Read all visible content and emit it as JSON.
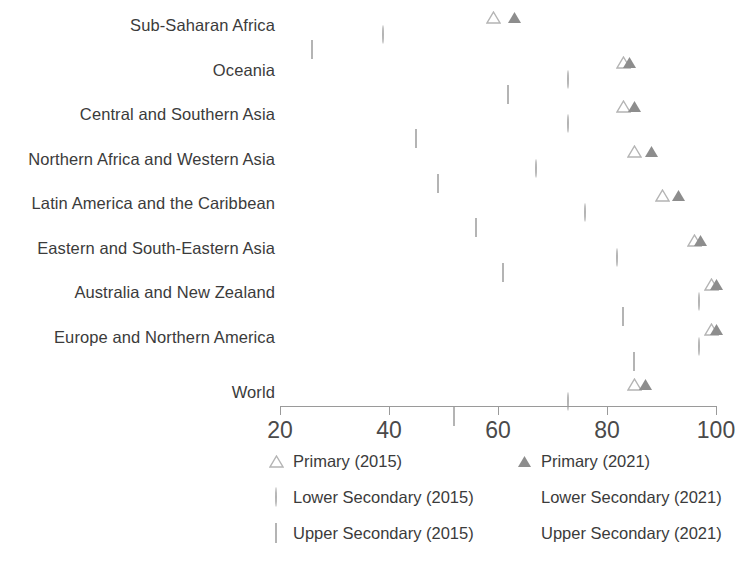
{
  "chart_data": {
    "type": "scatter",
    "title": "",
    "xlabel": "",
    "ylabel": "",
    "xlim": [
      20,
      100
    ],
    "xticks": [
      20,
      40,
      60,
      80,
      100
    ],
    "xtick_labels": [
      "20",
      "40",
      "60",
      "80",
      "100"
    ],
    "grid": false,
    "legend_position": "bottom",
    "categories": [
      "Sub-Saharan Africa",
      "Oceania",
      "Central and Southern Asia",
      "Northern Africa and Western Asia",
      "Latin America and the Caribbean",
      "Eastern and South-Eastern Asia",
      "Australia and New Zealand",
      "Europe and Northern America",
      "World"
    ],
    "series": [
      {
        "name": "Primary (2015)",
        "marker": "triangle-open",
        "color": "#b4b4b4",
        "values": [
          59,
          83,
          83,
          85,
          90,
          96,
          99,
          99,
          85
        ]
      },
      {
        "name": "Primary (2021)",
        "marker": "triangle-filled",
        "color": "#8d8d8d",
        "values": [
          63,
          84,
          85,
          88,
          93,
          97,
          100,
          100,
          87
        ]
      },
      {
        "name": "Lower Secondary (2015)",
        "marker": "circle-open",
        "color": "#b4b4b4",
        "values": [
          40,
          74,
          74,
          68,
          77,
          83,
          98,
          98,
          74
        ]
      },
      {
        "name": "Lower Secondary (2021)",
        "marker": "circle-filled",
        "color": "#8d8d8d",
        "values": [
          44,
          74,
          79,
          72,
          81,
          86,
          99,
          99,
          76
        ]
      },
      {
        "name": "Upper Secondary (2015)",
        "marker": "square-open",
        "color": "#b4b4b4",
        "values": [
          27,
          63,
          46,
          50,
          57,
          62,
          84,
          86,
          53
        ]
      },
      {
        "name": "Upper Secondary (2021)",
        "marker": "square-filled",
        "color": "#8d8d8d",
        "values": [
          30,
          60,
          53,
          55,
          62,
          70,
          86,
          88,
          57
        ]
      }
    ]
  },
  "legend": {
    "items": [
      {
        "label": "Primary (2015)",
        "marker": "triangle-open"
      },
      {
        "label": "Primary (2021)",
        "marker": "triangle-filled"
      },
      {
        "label": "Lower Secondary (2015)",
        "marker": "circle-open"
      },
      {
        "label": "Lower Secondary (2021)",
        "marker": "circle-filled"
      },
      {
        "label": "Upper Secondary (2015)",
        "marker": "square-open"
      },
      {
        "label": "Upper Secondary (2021)",
        "marker": "square-filled"
      }
    ]
  }
}
